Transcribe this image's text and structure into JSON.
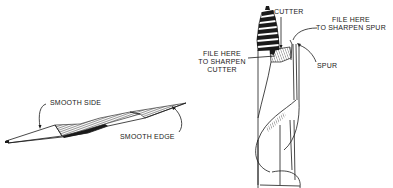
{
  "diagram": {
    "file_figure": {
      "labels": {
        "smooth_side": "SMOOTH SIDE",
        "smooth_edge": "SMOOTH EDGE"
      }
    },
    "auger_bit_figure": {
      "labels": {
        "cutter": "CUTTER",
        "file_spur_line1": "FILE HERE",
        "file_spur_line2": "TO SHARPEN SPUR",
        "spur": "SPUR",
        "file_cutter_line1": "FILE HERE",
        "file_cutter_line2": "TO SHARPEN",
        "file_cutter_line3": "CUTTER"
      }
    },
    "colors": {
      "ink": "#1a1a1a",
      "background": "#ffffff"
    }
  }
}
